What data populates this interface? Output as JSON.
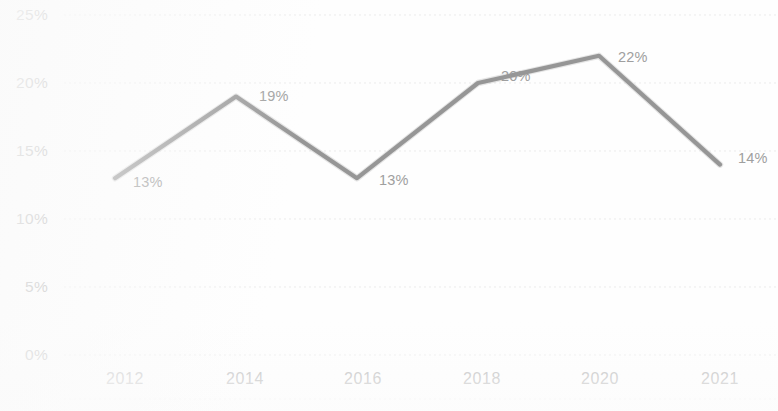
{
  "chart_data": {
    "type": "line",
    "title": "",
    "subtitle": "",
    "xlabel": "",
    "ylabel": "",
    "categories": [
      "2012",
      "2014",
      "2016",
      "2018",
      "2020",
      "2021"
    ],
    "x_tick_labels": [
      "2012",
      "2014",
      "2016",
      "2018",
      "2020",
      "2021"
    ],
    "y_tick_labels": [
      "25%",
      "20%",
      "15%",
      "10%",
      "5%",
      "0%"
    ],
    "y_tick_values": [
      25,
      20,
      15,
      10,
      5,
      0
    ],
    "values": [
      13,
      19,
      13,
      20,
      22,
      14
    ],
    "point_labels": [
      "13%",
      "19%",
      "13%",
      "20%",
      "22%",
      "14%"
    ],
    "series": [
      {
        "name": "",
        "values": [
          13,
          19,
          13,
          20,
          22,
          14
        ],
        "color": "#8b8b8b"
      }
    ],
    "ylim": [
      0,
      25
    ],
    "grid": true,
    "grid_axis": "y",
    "legend": false,
    "legend_position": "none",
    "units": "percent"
  },
  "axis": {
    "y": {
      "ticks": [
        {
          "label": "25%",
          "value": 25
        },
        {
          "label": "20%",
          "value": 20
        },
        {
          "label": "15%",
          "value": 15
        },
        {
          "label": "10%",
          "value": 10
        },
        {
          "label": "5%",
          "value": 5
        },
        {
          "label": "0%",
          "value": 0
        }
      ]
    },
    "x": {
      "ticks": [
        {
          "label": "2012"
        },
        {
          "label": "2014"
        },
        {
          "label": "2016"
        },
        {
          "label": "2018"
        },
        {
          "label": "2020"
        },
        {
          "label": "2021"
        }
      ]
    }
  },
  "style": {
    "line_color": "#8b8b8b",
    "grid_color": "#e9e9e9",
    "tick_label_color": "#9c9c9c",
    "data_label_color": "#9a9a9a",
    "background_color": "#fefefe"
  }
}
